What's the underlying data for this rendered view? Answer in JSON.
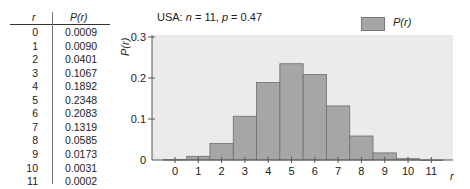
{
  "table": {
    "headers": {
      "r": "r",
      "p": "P(r)"
    },
    "rows": [
      {
        "r": "0",
        "p": "0.0009"
      },
      {
        "r": "1",
        "p": "0.0090"
      },
      {
        "r": "2",
        "p": "0.0401"
      },
      {
        "r": "3",
        "p": "0.1067"
      },
      {
        "r": "4",
        "p": "0.1892"
      },
      {
        "r": "5",
        "p": "0.2348"
      },
      {
        "r": "6",
        "p": "0.2083"
      },
      {
        "r": "7",
        "p": "0.1319"
      },
      {
        "r": "8",
        "p": "0.0585"
      },
      {
        "r": "9",
        "p": "0.0173"
      },
      {
        "r": "10",
        "p": "0.0031"
      },
      {
        "r": "11",
        "p": "0.0002"
      }
    ]
  },
  "chart_data": {
    "type": "bar",
    "title": "USA: n = 11, p = 0.47",
    "xlabel": "r",
    "ylabel": "P(r)",
    "categories": [
      "0",
      "1",
      "2",
      "3",
      "4",
      "5",
      "6",
      "7",
      "8",
      "9",
      "10",
      "11"
    ],
    "values": [
      0.0009,
      0.009,
      0.0401,
      0.1067,
      0.1892,
      0.2348,
      0.2083,
      0.1319,
      0.0585,
      0.0173,
      0.0031,
      0.0002
    ],
    "series": [
      {
        "name": "P(r)",
        "values": [
          0.0009,
          0.009,
          0.0401,
          0.1067,
          0.1892,
          0.2348,
          0.2083,
          0.1319,
          0.0585,
          0.0173,
          0.0031,
          0.0002
        ]
      }
    ],
    "ylim": [
      0,
      0.3
    ],
    "yticks": [
      "0",
      "0.1",
      "0.2",
      "0.3"
    ],
    "grid": false,
    "legend_position": "top-right",
    "colors": {
      "bar": "#a6a6a6",
      "bar_border": "#6e6e6e",
      "plot_bg": "#ebebeb"
    }
  },
  "title_parts": {
    "country": "USA: ",
    "n_label": "n",
    "n_value": " = 11, ",
    "p_label": "p",
    "p_value": " = 0.47"
  },
  "legend": {
    "label": "P(r)"
  }
}
